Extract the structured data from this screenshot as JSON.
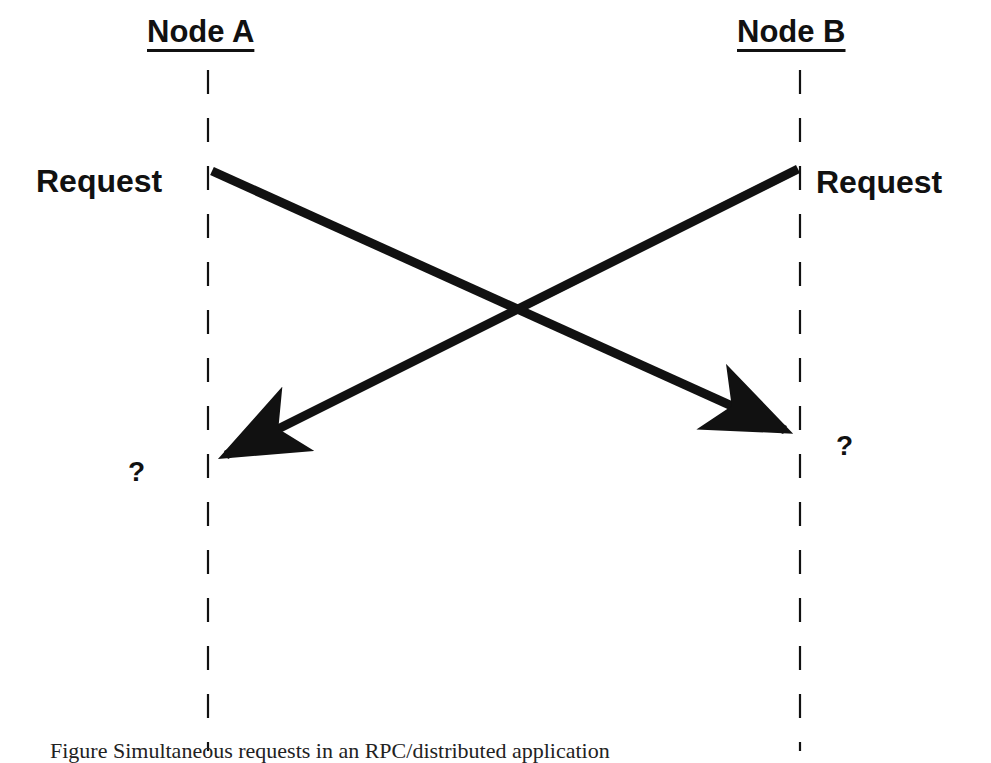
{
  "diagram": {
    "type": "sequence-diagram",
    "nodes": [
      {
        "id": "A",
        "label": "Node A",
        "x": 208
      },
      {
        "id": "B",
        "label": "Node B",
        "x": 800
      }
    ],
    "events": {
      "node_a_send": "Request",
      "node_b_send": "Request",
      "node_a_receive": "?",
      "node_b_receive": "?"
    },
    "messages": [
      {
        "from": "A",
        "to": "B",
        "from_y": 170,
        "to_y": 437,
        "label": "Request"
      },
      {
        "from": "B",
        "to": "A",
        "from_y": 170,
        "to_y": 463,
        "label": "Request"
      }
    ],
    "colors": {
      "ink": "#111111",
      "background": "#ffffff"
    }
  },
  "caption": {
    "text": "Figure      Simultaneous requests in an RPC/distributed application"
  }
}
